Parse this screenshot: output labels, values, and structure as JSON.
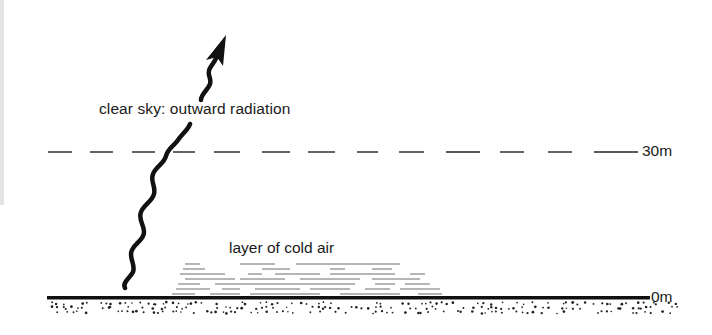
{
  "diagram": {
    "type": "cross-section",
    "labels": {
      "radiation": "clear sky: outward radiation",
      "cold_layer": "layer of cold air",
      "height_top": "30m",
      "height_ground": "0m"
    },
    "elements": [
      {
        "id": "radiation-arrow",
        "kind": "wavy-arrow",
        "direction": "upward",
        "from": "ground",
        "to": "sky"
      },
      {
        "id": "height-line-30m",
        "kind": "dashed-line",
        "label": "30m"
      },
      {
        "id": "cold-air-layer",
        "kind": "horizontal-hatching",
        "label": "layer of cold air"
      },
      {
        "id": "ground-surface",
        "kind": "solid-line-with-stipple",
        "label": "0m"
      }
    ],
    "colors": {
      "ink": "#111111",
      "background": "#ffffff",
      "hatching": "#555555"
    }
  }
}
